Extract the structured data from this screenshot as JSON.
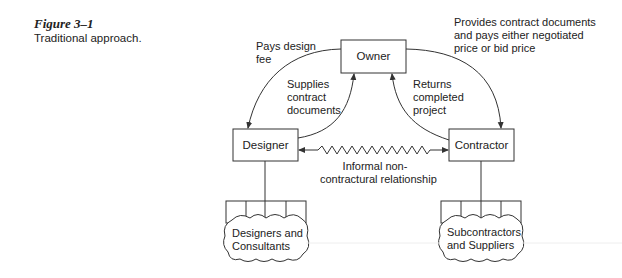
{
  "caption": {
    "figure_number": "Figure 3–1",
    "title": "Traditional approach."
  },
  "nodes": {
    "owner": "Owner",
    "designer": "Designer",
    "contractor": "Contractor",
    "designers_cloud": [
      "Designers and",
      "Consultants"
    ],
    "subcontractors_cloud": [
      "Subcontractors",
      "and Suppliers"
    ]
  },
  "edges": {
    "owner_to_designer": [
      "Pays design",
      "fee"
    ],
    "designer_to_owner": [
      "Supplies",
      "contract",
      "documents"
    ],
    "contractor_to_owner": [
      "Returns",
      "completed",
      "project"
    ],
    "owner_to_contractor": [
      "Provides contract documents",
      "and pays either negotiated",
      "price or bid price"
    ],
    "designer_contractor": [
      "Informal non-",
      "contractural relationship"
    ]
  },
  "colors": {
    "line": "#333333",
    "text": "#222222",
    "background": "#ffffff"
  }
}
